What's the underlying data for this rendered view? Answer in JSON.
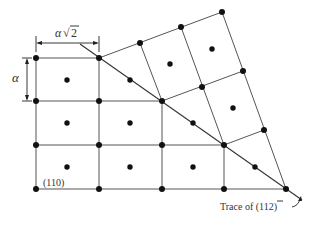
{
  "diagram": {
    "labels": {
      "width_dimension": "α√2",
      "width_alpha": "α",
      "height_dimension": "α",
      "plane": "(110)",
      "trace_prefix": "Trace of (",
      "trace_bar_digit": "1",
      "trace_suffix": "12)"
    },
    "colors": {
      "line": "#555555",
      "atom": "#111111",
      "text": "#333333"
    }
  }
}
